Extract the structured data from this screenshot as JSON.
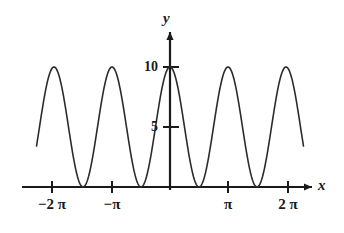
{
  "figure": {
    "background_color": "#ffffff",
    "line_color": "#2b2b2b",
    "axis_color": "#1a1a1a"
  },
  "axes": {
    "x_label": "x",
    "y_label": "y"
  },
  "ticks": {
    "x": [
      {
        "label": "−2 π",
        "value": -6.2832
      },
      {
        "label": "−π",
        "value": -3.1416
      },
      {
        "label": "π",
        "value": 3.1416
      },
      {
        "label": "2 π",
        "value": 6.2832
      }
    ],
    "y": [
      {
        "label": "5",
        "value": 5
      },
      {
        "label": "10",
        "value": 10
      }
    ]
  },
  "chart_data": {
    "type": "line",
    "title": "",
    "xlabel": "x",
    "ylabel": "y",
    "grid": false,
    "legend": false,
    "xlim": [
      -7.35,
      7.35
    ],
    "ylim": [
      0,
      11.3
    ],
    "xticks": [
      -6.2832,
      -3.1416,
      3.1416,
      6.2832
    ],
    "xticklabels": [
      "−2 π",
      "−π",
      "π",
      "2 π"
    ],
    "yticks": [
      5,
      10
    ],
    "yticklabels": [
      "5",
      "10"
    ],
    "series": [
      {
        "name": "y = 10 cos^2(x)",
        "expression": "10*cos(x)^2",
        "color": "#2b2b2b",
        "linewidth": 1.6,
        "x": [
          -7.23,
          -7.0,
          -6.75,
          -6.5,
          -6.2832,
          -6.0,
          -5.75,
          -5.5,
          -5.25,
          -4.7124,
          -4.5,
          -4.25,
          -4.0,
          -3.75,
          -3.5,
          -3.1416,
          -3.0,
          -2.75,
          -2.5,
          -2.25,
          -1.5708,
          -1.25,
          -1.0,
          -0.75,
          -0.5,
          -0.25,
          0,
          0.25,
          0.5,
          0.75,
          1.0,
          1.25,
          1.5708,
          2.25,
          2.5,
          2.75,
          3.0,
          3.1416,
          3.5,
          3.75,
          4.0,
          4.25,
          4.5,
          4.7124,
          5.25,
          5.5,
          5.75,
          6.0,
          6.2832,
          6.5,
          6.75,
          7.0,
          7.23
        ],
        "y": [
          5.91,
          7.69,
          9.24,
          9.95,
          10.0,
          9.17,
          7.35,
          5.03,
          2.72,
          0.0,
          0.43,
          1.93,
          4.27,
          6.78,
          8.77,
          10.0,
          9.8,
          8.49,
          6.41,
          3.89,
          0.0,
          0.99,
          2.92,
          5.35,
          7.7,
          9.4,
          10.0,
          9.4,
          7.7,
          5.35,
          2.92,
          0.99,
          0.0,
          3.89,
          6.41,
          8.49,
          9.8,
          10.0,
          8.77,
          6.78,
          4.27,
          1.93,
          0.43,
          0.0,
          2.72,
          5.03,
          7.35,
          9.17,
          10.0,
          9.95,
          9.24,
          7.69,
          5.91
        ]
      }
    ],
    "zeros": [
      -4.7124,
      -1.5708,
      1.5708,
      4.7124
    ],
    "maxima": [
      {
        "x": -6.2832,
        "y": 10
      },
      {
        "x": -3.1416,
        "y": 10
      },
      {
        "x": 0,
        "y": 10
      },
      {
        "x": 3.1416,
        "y": 10
      },
      {
        "x": 6.2832,
        "y": 10
      }
    ]
  }
}
